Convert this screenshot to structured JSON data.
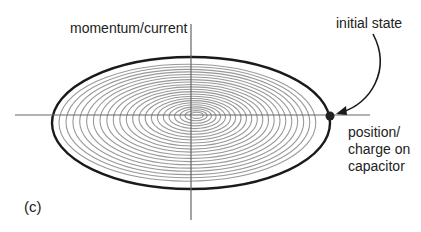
{
  "labels": {
    "y_axis": "momentum/current",
    "initial": "initial state",
    "x_axis_line1": "position/",
    "x_axis_line2": "charge on",
    "x_axis_line3": "capacitor",
    "panel": "(c)"
  },
  "colors": {
    "axis": "#666666",
    "outer": "#1a1a1a",
    "spiral": "#999999",
    "dot": "#222222"
  },
  "geometry": {
    "center": [
      191,
      120
    ],
    "outer_rx": 139,
    "outer_ry": 66,
    "spiral_rings": 22
  }
}
